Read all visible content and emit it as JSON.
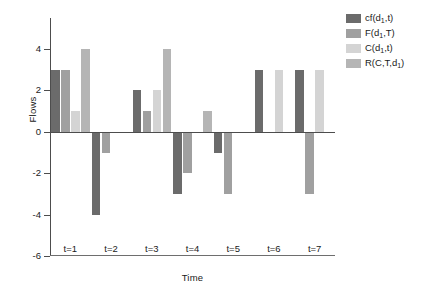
{
  "chart_data": {
    "type": "bar",
    "title": "",
    "xlabel": "Time",
    "ylabel": "Flows",
    "categories": [
      "t=1",
      "t=2",
      "t=3",
      "t=4",
      "t=5",
      "t=6",
      "t=7"
    ],
    "ylim": [
      -6,
      5.5
    ],
    "yticks": [
      4,
      2,
      0,
      -2,
      -4,
      -6
    ],
    "ytick_labels": [
      "4",
      "2",
      "0",
      "-2",
      "-4",
      "-6"
    ],
    "grid": false,
    "legend_position": "right",
    "series": [
      {
        "name": "cf(d1,t)",
        "color": "#6b6b6b",
        "values": [
          3,
          -4,
          2,
          -3,
          -1,
          3,
          3
        ]
      },
      {
        "name": "F(d1,T)",
        "color": "#a0a0a0",
        "values": [
          3,
          -1,
          1,
          -2,
          -3,
          0,
          -3
        ]
      },
      {
        "name": "C(d1,t)",
        "color": "#d4d4d4",
        "values": [
          1,
          0,
          2,
          0,
          0,
          3,
          3
        ]
      },
      {
        "name": "R(C,T,d1)",
        "color": "#b5b5b5",
        "values": [
          4,
          0,
          4,
          1,
          0,
          0,
          0
        ]
      }
    ]
  },
  "legend": {
    "entries": [
      {
        "label_main": "cf(d",
        "label_sub": "1",
        "label_tail": ",t)",
        "color": "#6b6b6b",
        "name": "cf-d1-t"
      },
      {
        "label_main": "F(d",
        "label_sub": "1",
        "label_tail": ",T)",
        "color": "#a0a0a0",
        "name": "f-d1-t"
      },
      {
        "label_main": "C(d",
        "label_sub": "1",
        "label_tail": ",t)",
        "color": "#d4d4d4",
        "name": "c-d1-t"
      },
      {
        "label_main": "R(C,T,d",
        "label_sub": "1",
        "label_tail": ")",
        "color": "#b5b5b5",
        "name": "r-c-t-d1"
      }
    ]
  },
  "axes": {
    "y_title": "Flows",
    "x_title": "Time"
  }
}
